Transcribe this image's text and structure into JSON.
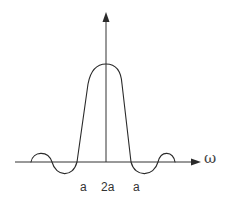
{
  "diagram": {
    "type": "sinc-like spectrum plot",
    "axes": {
      "horizontal_label": "ω",
      "vertical_label": ""
    },
    "tick_labels": [
      {
        "text": "a",
        "position": "left zero crossing of main lobe"
      },
      {
        "text": "2a",
        "position": "center (main lobe width)"
      },
      {
        "text": "a",
        "position": "right zero crossing of main lobe"
      }
    ],
    "curve": {
      "description": "Central main lobe with flattened rounded peak, flanked by one negative side lobe and one positive side lobe on each side",
      "stroke_color": "#2a2a2a"
    }
  }
}
